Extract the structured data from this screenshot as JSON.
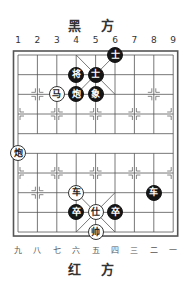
{
  "header": {
    "title": "黑 方"
  },
  "footer": {
    "title": "红 方"
  },
  "board": {
    "columns": 9,
    "rows": 10,
    "grid_left": 18,
    "grid_top": 55,
    "col_spacing": 19.4,
    "row_spacing": 19.67,
    "line_color": "#555555",
    "black_piece_color": "#151515",
    "red_piece_color": "#ffffff"
  },
  "top_column_labels": [
    "1",
    "2",
    "3",
    "4",
    "5",
    "6",
    "7",
    "8",
    "9"
  ],
  "bottom_column_labels": [
    "九",
    "八",
    "七",
    "六",
    "五",
    "四",
    "三",
    "二",
    "一"
  ],
  "pieces": [
    {
      "side": "black",
      "char": "士",
      "col": 6,
      "row": 0,
      "name": "black-advisor"
    },
    {
      "side": "black",
      "char": "将",
      "col": 4,
      "row": 1,
      "name": "black-general"
    },
    {
      "side": "black",
      "char": "士",
      "col": 5,
      "row": 1,
      "name": "black-advisor"
    },
    {
      "side": "black",
      "char": "炮",
      "col": 4,
      "row": 2,
      "name": "black-cannon"
    },
    {
      "side": "black",
      "char": "象",
      "col": 5,
      "row": 2,
      "name": "black-elephant"
    },
    {
      "side": "black",
      "char": "车",
      "col": 8,
      "row": 7,
      "name": "black-chariot"
    },
    {
      "side": "black",
      "char": "卒",
      "col": 4,
      "row": 8,
      "name": "black-soldier"
    },
    {
      "side": "black",
      "char": "卒",
      "col": 6,
      "row": 8,
      "name": "black-soldier"
    },
    {
      "side": "red",
      "char": "马",
      "col": 3,
      "row": 2,
      "name": "red-horse"
    },
    {
      "side": "red",
      "char": "炮",
      "col": 1,
      "row": 5,
      "name": "red-cannon"
    },
    {
      "side": "red",
      "char": "车",
      "col": 4,
      "row": 7,
      "name": "red-chariot"
    },
    {
      "side": "red",
      "char": "仕",
      "col": 5,
      "row": 8,
      "name": "red-advisor"
    },
    {
      "side": "red",
      "char": "帅",
      "col": 5,
      "row": 9,
      "name": "red-general"
    }
  ]
}
